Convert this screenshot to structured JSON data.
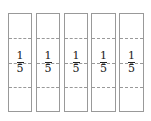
{
  "diagram": {
    "bars": [
      {
        "numerator": "1",
        "denominator": "5"
      },
      {
        "numerator": "1",
        "denominator": "5"
      },
      {
        "numerator": "1",
        "denominator": "5"
      },
      {
        "numerator": "1",
        "denominator": "5"
      },
      {
        "numerator": "1",
        "denominator": "5"
      }
    ]
  }
}
